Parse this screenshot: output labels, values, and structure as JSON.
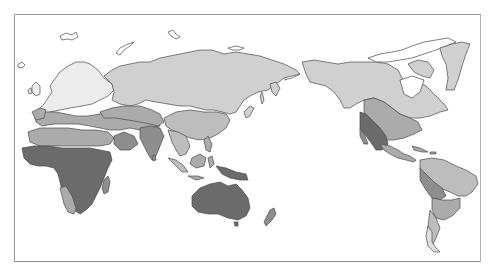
{
  "map": {
    "projection": "pacific-centered-world",
    "legend": [],
    "title": "",
    "shades": {
      "very_light": "#ececec",
      "light": "#d0d0d0",
      "medium": "#ababab",
      "dark": "#8e8e8e",
      "darkest": "#6b6b6b",
      "water": "#ffffff",
      "outline": "#4a4a4a",
      "frame": "#9a9a9a"
    },
    "regions": [
      {
        "name": "northern-europe",
        "shade": "very_light"
      },
      {
        "name": "eurasia-north",
        "shade": "light"
      },
      {
        "name": "north-america-north",
        "shade": "light"
      },
      {
        "name": "greenland",
        "shade": "light"
      },
      {
        "name": "mediterranean-middle-east",
        "shade": "medium"
      },
      {
        "name": "central-asia",
        "shade": "medium"
      },
      {
        "name": "north-africa-sahel",
        "shade": "medium"
      },
      {
        "name": "south-asia",
        "shade": "dark"
      },
      {
        "name": "southeast-asia",
        "shade": "medium"
      },
      {
        "name": "sub-saharan-africa",
        "shade": "darkest"
      },
      {
        "name": "australia",
        "shade": "darkest"
      },
      {
        "name": "new-guinea",
        "shade": "darkest"
      },
      {
        "name": "new-zealand",
        "shade": "dark"
      },
      {
        "name": "usa-central",
        "shade": "medium"
      },
      {
        "name": "usa-southwest-mexico",
        "shade": "darkest"
      },
      {
        "name": "central-america",
        "shade": "medium"
      },
      {
        "name": "south-america-north",
        "shade": "medium"
      },
      {
        "name": "south-america-andes",
        "shade": "dark"
      },
      {
        "name": "south-america-south",
        "shade": "light"
      }
    ]
  }
}
